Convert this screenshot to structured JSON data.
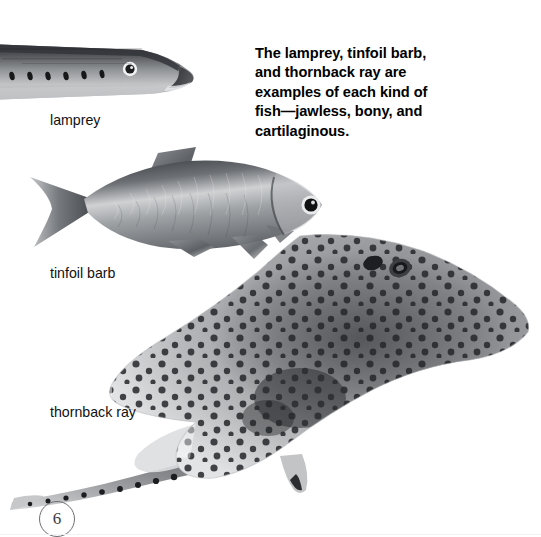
{
  "page": {
    "background_color": "#ffffff",
    "width": 541,
    "height": 537,
    "folio_number": "6"
  },
  "caption": {
    "full_text": "The lamprey, tinfoil barb, and thornback ray are examples of each kind of fish—jawless, bony, and cartilaginous.",
    "lines": [
      "The lamprey, tinfoil barb,",
      "and thornback ray are",
      "examples of each kind of",
      "fish—jawless, bony, and",
      "cartilaginous."
    ],
    "color": "#000000",
    "weight": "bold"
  },
  "figures": [
    {
      "id": "lamprey",
      "label": "lamprey",
      "kind": "jawless",
      "description": "grayscale photograph of a lamprey, head facing right, row of seven gill slits behind the eye",
      "tone_dark": "#2f3033",
      "tone_mid": "#8b8d90",
      "tone_light": "#d6d8da"
    },
    {
      "id": "tinfoil-barb",
      "label": "tinfoil barb",
      "kind": "bony",
      "description": "grayscale photograph of a tinfoil barb, head facing right, forked tail, scaly silver body",
      "tone_dark": "#3a3c40",
      "tone_mid": "#9a9da1",
      "tone_light": "#e2e4e6"
    },
    {
      "id": "thornback-ray",
      "label": "thornback ray",
      "kind": "cartilaginous",
      "description": "grayscale photograph of a thornback ray seen from above, diamond-shaped spotted body with long thorny tail curving to the lower left",
      "tone_dark": "#2b2c2f",
      "tone_mid": "#8a8c8f",
      "tone_light": "#dfe1e3"
    }
  ]
}
